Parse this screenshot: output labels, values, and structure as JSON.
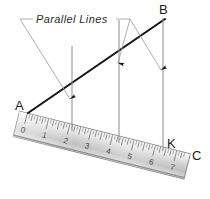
{
  "figure": {
    "title_note": "Parallel Lines",
    "background_color": "#ffffff",
    "line_color": "#1a1a1a",
    "leader_color": "#9a9a9a",
    "parallel_color": "#8c8c8c"
  },
  "callout": {
    "label": "Parallel Lines"
  },
  "points": [
    {
      "name": "A",
      "label": "A",
      "x": 22,
      "y": 104
    },
    {
      "name": "B",
      "label": "B",
      "x": 164,
      "y": 12
    },
    {
      "name": "K",
      "label": "K",
      "x": 172,
      "y": 143
    },
    {
      "name": "C",
      "label": "C",
      "x": 196,
      "y": 155
    }
  ],
  "ruler": {
    "numbers": [
      "0",
      "1",
      "2",
      "3",
      "4",
      "5",
      "6",
      "7"
    ],
    "start_value": 0,
    "end_value": 7,
    "tilt_degrees": 14,
    "body_color_light": "#f2f2f2",
    "body_color_mid": "#c9c9c9",
    "edge_color": "#7d7d7d"
  },
  "parallel_lines": [
    {
      "name": "line-at-2",
      "ruler_mark": "2",
      "top_x": 72,
      "top_y": 46,
      "bottom_x": 72,
      "bottom_y": 131
    },
    {
      "name": "line-at-4",
      "ruler_mark": "4",
      "top_x": 119,
      "top_y": 20,
      "bottom_x": 119,
      "bottom_y": 143
    },
    {
      "name": "line-at-6",
      "ruler_mark": "6",
      "top_x": 163,
      "top_y": 18,
      "bottom_x": 163,
      "bottom_y": 150
    }
  ],
  "diagonal": {
    "name": "line-AB",
    "from": "A",
    "to": "B"
  }
}
